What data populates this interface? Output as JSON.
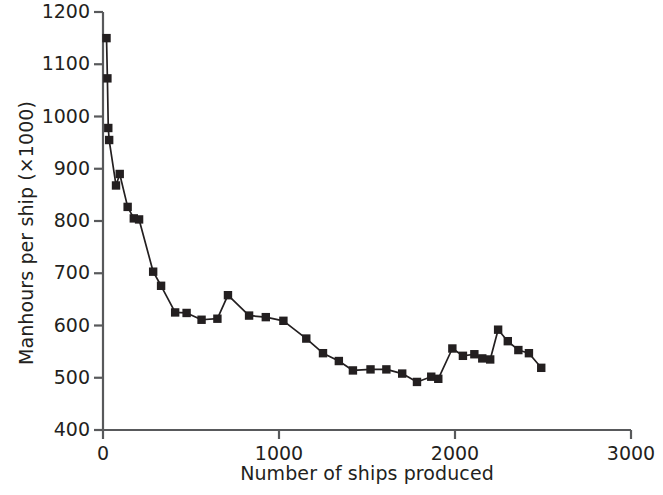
{
  "chart_data": {
    "type": "line",
    "title": "",
    "subtitle": "",
    "xlabel": "Number of ships produced",
    "ylabel": "Manhours per ship (×1000)",
    "xlim": [
      0,
      3000
    ],
    "ylim": [
      400,
      1200
    ],
    "xticks": [
      0,
      1000,
      2000,
      3000
    ],
    "yticks": [
      400,
      500,
      600,
      700,
      800,
      900,
      1000,
      1100,
      1200
    ],
    "xtick_labels": [
      "0",
      "1000",
      "2000",
      "3000"
    ],
    "ytick_labels": [
      "400",
      "500",
      "600",
      "700",
      "800",
      "900",
      "1000",
      "1100",
      "1200"
    ],
    "grid": false,
    "legend": false,
    "legend_position": "none",
    "marker": "square",
    "marker_color": "#231f20",
    "line_color": "#231f20",
    "series": [
      {
        "name": "Manhours per ship",
        "points": [
          [
            20,
            1150
          ],
          [
            25,
            1073
          ],
          [
            30,
            978
          ],
          [
            35,
            955
          ],
          [
            74,
            868
          ],
          [
            95,
            890
          ],
          [
            140,
            827
          ],
          [
            175,
            805
          ],
          [
            205,
            803
          ],
          [
            285,
            703
          ],
          [
            330,
            676
          ],
          [
            410,
            625
          ],
          [
            475,
            624
          ],
          [
            560,
            611
          ],
          [
            650,
            613
          ],
          [
            710,
            658
          ],
          [
            830,
            619
          ],
          [
            925,
            616
          ],
          [
            1025,
            609
          ],
          [
            1155,
            575
          ],
          [
            1250,
            547
          ],
          [
            1340,
            532
          ],
          [
            1420,
            514
          ],
          [
            1520,
            516
          ],
          [
            1610,
            516
          ],
          [
            1700,
            508
          ],
          [
            1784,
            492
          ],
          [
            1865,
            502
          ],
          [
            1905,
            498
          ],
          [
            1985,
            556
          ],
          [
            2045,
            542
          ],
          [
            2110,
            545
          ],
          [
            2155,
            537
          ],
          [
            2200,
            535
          ],
          [
            2245,
            592
          ],
          [
            2300,
            570
          ],
          [
            2360,
            553
          ],
          [
            2420,
            547
          ],
          [
            2490,
            519
          ]
        ]
      }
    ]
  },
  "axes": {
    "x_title": "Number of ships produced",
    "y_title": "Manhours per ship (×1000)"
  }
}
